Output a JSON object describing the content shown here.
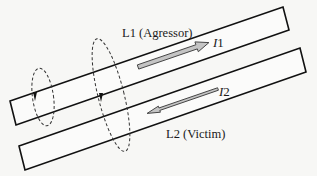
{
  "diagram": {
    "type": "crosstalk-coupled-transmission-lines",
    "lines": [
      {
        "id": "L1",
        "label": "L1 (Agressor)",
        "role": "aggressor"
      },
      {
        "id": "L2",
        "label": "L2 (Victim)",
        "role": "victim"
      }
    ],
    "currents": [
      {
        "id": "I1",
        "label_main": "I",
        "label_sub": "1",
        "direction": "forward",
        "on_line": "L1"
      },
      {
        "id": "I2",
        "label_main": "I",
        "label_sub": "2",
        "direction": "backward",
        "on_line": "L2"
      }
    ],
    "loops": [
      {
        "id": "loop-small",
        "encloses": [
          "L1"
        ],
        "style": "dashed"
      },
      {
        "id": "loop-large",
        "encloses": [
          "L1",
          "L2"
        ],
        "style": "dashed"
      }
    ],
    "markers": [
      {
        "id": "marker-1",
        "shape": "triangle",
        "on_line": "L1"
      },
      {
        "id": "marker-2",
        "shape": "triangle",
        "on_line": "L1"
      }
    ],
    "colors": {
      "background": "#f7f7f5",
      "line_stroke": "#111111",
      "arrow_fill": "#c4c4c4"
    }
  }
}
